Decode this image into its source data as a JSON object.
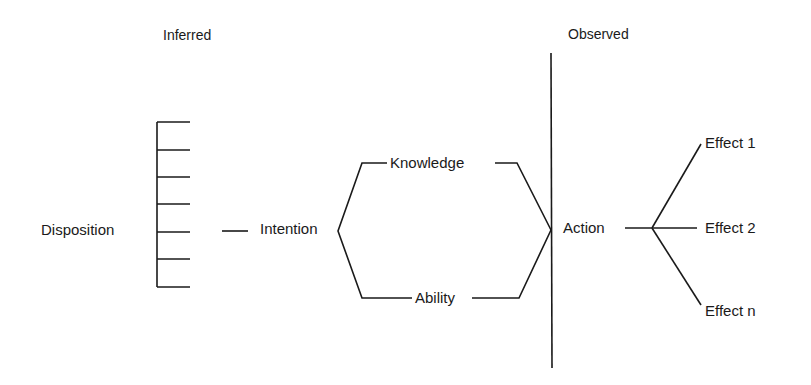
{
  "headers": {
    "inferred": "Inferred",
    "observed": "Observed"
  },
  "nodes": {
    "disposition": "Disposition",
    "intention": "Intention",
    "knowledge": "Knowledge",
    "ability": "Ability",
    "action": "Action",
    "effects": [
      "Effect 1",
      "Effect 2",
      "Effect n"
    ]
  },
  "colors": {
    "line": "#1a1a1a",
    "background": "#ffffff"
  }
}
